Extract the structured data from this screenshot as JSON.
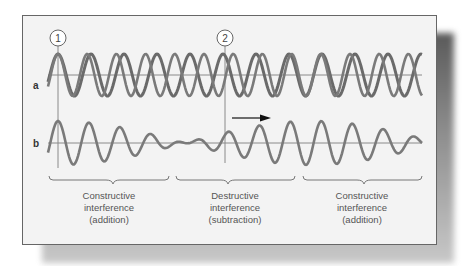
{
  "markers": [
    {
      "label": "1",
      "x": 58
    },
    {
      "label": "2",
      "x": 225
    }
  ],
  "row_labels": {
    "a": "a",
    "b": "b"
  },
  "captions": [
    {
      "line1": "Constructive",
      "line2": "interference",
      "line3": "(addition)"
    },
    {
      "line1": "Destructive",
      "line2": "interference",
      "line3": "(subtraction)"
    },
    {
      "line1": "Constructive",
      "line2": "interference",
      "line3": "(addition)"
    }
  ],
  "colors": {
    "wave": "#707070",
    "axis": "#8a8a8a",
    "arrow": "#111111",
    "frame": "#666666",
    "background": "#f3f3f3"
  },
  "arrow": {
    "direction": "right"
  }
}
